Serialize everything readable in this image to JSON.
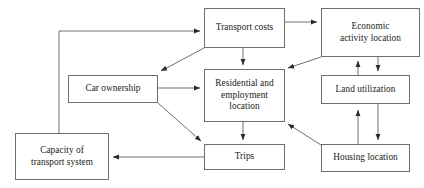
{
  "diagram": {
    "type": "flow-diagram",
    "title": "",
    "background_color": "#ffffff",
    "line_color": "#6e6e6e",
    "text_color": "#1a1a1a",
    "nodes": [
      {
        "id": "transport_costs",
        "label": "Transport costs",
        "x": 204,
        "y": 8,
        "w": 81,
        "h": 40
      },
      {
        "id": "economic_activity_location",
        "label": "Economic\nactivity location",
        "x": 321,
        "y": 8,
        "w": 99,
        "h": 49
      },
      {
        "id": "car_ownership",
        "label": "Car ownership",
        "x": 68,
        "y": 75,
        "w": 90,
        "h": 28
      },
      {
        "id": "residential_employment_location",
        "label": "Residential and\nemployment\nlocation",
        "x": 204,
        "y": 69,
        "w": 81,
        "h": 53
      },
      {
        "id": "land_utilization",
        "label": "Land utilization",
        "x": 321,
        "y": 75,
        "w": 89,
        "h": 29
      },
      {
        "id": "capacity_of_transport_system",
        "label": "Capacity of\ntransport system",
        "x": 15,
        "y": 133,
        "w": 94,
        "h": 47
      },
      {
        "id": "trips",
        "label": "Trips",
        "x": 204,
        "y": 144,
        "w": 81,
        "h": 26
      },
      {
        "id": "housing_location",
        "label": "Housing location",
        "x": 321,
        "y": 144,
        "w": 89,
        "h": 28
      }
    ],
    "edges": [
      {
        "id": "capacity-to-transport-costs",
        "from": "capacity_of_transport_system",
        "to": "transport_costs",
        "path": "M 59 133 L 59 31 L 200 31",
        "arrow_at": [
          204,
          31
        ],
        "arrow_dir": "right"
      },
      {
        "id": "transport-costs-to-economic-activity",
        "from": "transport_costs",
        "to": "economic_activity_location",
        "path": "M 285 22 L 317 22",
        "arrow_at": [
          321,
          22
        ],
        "arrow_dir": "right"
      },
      {
        "id": "transport-costs-to-car-ownership",
        "from": "transport_costs",
        "to": "car_ownership",
        "path": "M 204 48 L 161 71",
        "arrow_at": [
          158,
          73
        ],
        "arrow_dir": "down-left"
      },
      {
        "id": "transport-costs-to-residential",
        "from": "transport_costs",
        "to": "residential_employment_location",
        "path": "M 243 48 L 243 65",
        "arrow_at": [
          243,
          69
        ],
        "arrow_dir": "down"
      },
      {
        "id": "economic-activity-to-residential",
        "from": "economic_activity_location",
        "to": "residential_employment_location",
        "path": "M 321 57 L 288 68",
        "arrow_at": [
          285,
          69
        ],
        "arrow_dir": "down-left"
      },
      {
        "id": "economic-activity-to-land-utilization",
        "from": "economic_activity_location",
        "to": "land_utilization",
        "path": "M 378 57 L 378 71",
        "arrow_at": [
          378,
          75
        ],
        "arrow_dir": "down"
      },
      {
        "id": "land-utilization-to-economic-activity",
        "from": "land_utilization",
        "to": "economic_activity_location",
        "path": "M 358 75 L 358 61",
        "arrow_at": [
          358,
          57
        ],
        "arrow_dir": "up"
      },
      {
        "id": "car-ownership-to-residential",
        "from": "car_ownership",
        "to": "residential_employment_location",
        "path": "M 158 88 L 200 88",
        "arrow_at": [
          204,
          88
        ],
        "arrow_dir": "right"
      },
      {
        "id": "car-ownership-to-trips",
        "from": "car_ownership",
        "to": "trips",
        "path": "M 158 103 L 201 141",
        "arrow_at": [
          204,
          144
        ],
        "arrow_dir": "down-right"
      },
      {
        "id": "residential-to-trips",
        "from": "residential_employment_location",
        "to": "trips",
        "path": "M 243 122 L 243 140",
        "arrow_at": [
          243,
          144
        ],
        "arrow_dir": "down"
      },
      {
        "id": "housing-location-to-residential",
        "from": "housing_location",
        "to": "residential_employment_location",
        "path": "M 321 145 L 288 124",
        "arrow_at": [
          285,
          122
        ],
        "arrow_dir": "up-left"
      },
      {
        "id": "housing-location-to-land-utilization",
        "from": "housing_location",
        "to": "land_utilization",
        "path": "M 358 144 L 358 110",
        "arrow_at": [
          358,
          104
        ],
        "arrow_dir": "up"
      },
      {
        "id": "land-utilization-to-housing-location",
        "from": "land_utilization",
        "to": "housing_location",
        "path": "M 378 104 L 378 140",
        "arrow_at": [
          378,
          144
        ],
        "arrow_dir": "down"
      },
      {
        "id": "trips-to-capacity",
        "from": "trips",
        "to": "capacity_of_transport_system",
        "path": "M 204 157 L 113 157",
        "arrow_at": [
          109,
          157
        ],
        "arrow_dir": "left"
      }
    ]
  }
}
